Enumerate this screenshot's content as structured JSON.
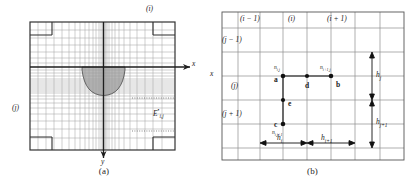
{
  "figure": {
    "panels": [
      {
        "id": "a",
        "caption": "(a)",
        "axis_x_label": "x",
        "axis_y_label": "y",
        "index_i_label": "(i)",
        "index_j_label": "(j)",
        "cell_label_base": "E",
        "cell_label_sub": "i,j",
        "cell_label_sup": "•",
        "description": "Non-uniform finite-difference mesh over a rectangular domain with a shaded parabolic (U-shaped) sub-region centred on the origin; x axis points right, y axis points down.",
        "grid": {
          "frame": {
            "x": 30,
            "y": 22,
            "width": 145,
            "height": 128
          },
          "vertical_lines": [
            30,
            38,
            46,
            54,
            62,
            69,
            75,
            80,
            85,
            89,
            93,
            96,
            99,
            101,
            102.4,
            103.5,
            104.6,
            105.7,
            107,
            109,
            112,
            115,
            119,
            124,
            130,
            137,
            145,
            153,
            162,
            175
          ],
          "horizontal_lines": [
            22,
            30,
            38,
            45,
            52,
            58,
            63,
            67,
            70,
            73,
            76,
            79,
            81,
            83,
            85,
            87,
            89,
            91,
            93,
            96,
            99,
            103,
            108,
            114,
            121,
            129,
            138,
            150
          ],
          "dense_center_x": 103.5,
          "axis_y_value": 67
        },
        "shaded_region": {
          "fill": "#9a9a9a",
          "opacity": 0.72,
          "left_x": 82,
          "right_x": 125,
          "top_y": 67,
          "bottom_y": 95
        },
        "dotted_segments": [
          {
            "x1": 132,
            "y1": 98,
            "x2": 175,
            "y2": 98
          },
          {
            "x1": 132,
            "y1": 131,
            "x2": 175,
            "y2": 131
          }
        ],
        "corner_blocks": [
          {
            "x": 30,
            "y": 22,
            "width": 22,
            "height": 13
          },
          {
            "x": 153,
            "y": 22,
            "width": 22,
            "height": 13
          },
          {
            "x": 30,
            "y": 137,
            "width": 22,
            "height": 13
          },
          {
            "x": 153,
            "y": 137,
            "width": 22,
            "height": 13
          }
        ]
      },
      {
        "id": "b",
        "caption": "(b)",
        "axis_x_label": "x",
        "column_labels": [
          "(i − 1)",
          "(i)",
          "(i + 1)"
        ],
        "row_labels": [
          "(j − 1)",
          "(j)",
          "(j + 1)"
        ],
        "nodes": [
          {
            "tag": "a",
            "name": "n_{i,j}",
            "name_base": "n",
            "name_sub": "i,j",
            "x": 75,
            "y": 76,
            "tag_dx": -9,
            "tag_dy": 3,
            "name_dx": -9,
            "name_dy": -5
          },
          {
            "tag": "b",
            "name": "n_{i+1,j}",
            "name_base": "n",
            "name_sub": "i+1,j",
            "x": 123,
            "y": 76,
            "tag_dx": 5,
            "tag_dy": 8,
            "name_dx": -11,
            "name_dy": -5
          },
          {
            "tag": "c",
            "name": "n_{i,j+1}",
            "name_base": "n",
            "name_sub": "i,j+1",
            "x": 75,
            "y": 124,
            "tag_dx": -9,
            "tag_dy": 0,
            "name_dx": -9,
            "name_dy": 11
          },
          {
            "tag": "d",
            "name": "",
            "name_base": "",
            "name_sub": "",
            "x": 99,
            "y": 76,
            "tag_dx": -2,
            "tag_dy": 10,
            "name_dx": 0,
            "name_dy": 0
          },
          {
            "tag": "e",
            "name": "",
            "name_base": "",
            "name_sub": "",
            "x": 75,
            "y": 100,
            "tag_dx": 5,
            "tag_dy": 3,
            "name_dx": 0,
            "name_dy": 0
          }
        ],
        "dimensions": {
          "horizontal": [
            {
              "label_base": "h",
              "label_sub": "i",
              "x1": 52,
              "x2": 99,
              "y": 143
            },
            {
              "label_base": "h",
              "label_sub": "i+1",
              "x1": 99,
              "x2": 147,
              "y": 143
            }
          ],
          "vertical": [
            {
              "label_base": "h",
              "label_sub": "j",
              "y1": 52,
              "y2": 100,
              "x": 164
            },
            {
              "label_base": "h",
              "label_sub": "j+1",
              "y1": 100,
              "y2": 148,
              "x": 164
            }
          ]
        },
        "grid": {
          "frame": {
            "x": 14,
            "y": 12,
            "width": 182,
            "height": 148
          },
          "vertical_lines": [
            14,
            30,
            52,
            75,
            99,
            123,
            147,
            172,
            196
          ],
          "horizontal_lines": [
            12,
            28,
            52,
            76,
            100,
            124,
            148,
            160
          ],
          "description": "Uniform-looking mesh of cells with stencil nodes a, b, c, d, e marking a finite-difference molecule."
        }
      }
    ]
  },
  "colors": {
    "frame_stroke": "#3a3a3a",
    "grid_stroke": "#8e8e8e",
    "grid_stroke_light": "#a9a9a9",
    "axis_stroke": "#222222",
    "shade_fill": "#9a9a9a",
    "node_fill": "#111111",
    "text": "#1f1f1f",
    "background": "#ffffff"
  }
}
